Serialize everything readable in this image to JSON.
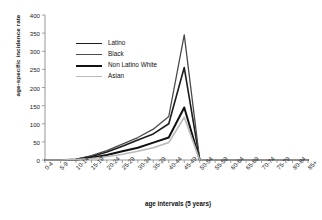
{
  "axes": {
    "ylabel": "age-specific incidence rate",
    "xlabel": "age intervals (5 years)"
  },
  "legend": {
    "position": "upper-center-left",
    "entries": [
      {
        "label": "Latino",
        "color": "#1c1c1c",
        "width": 1.6
      },
      {
        "label": "Black",
        "color": "#4a4a4a",
        "width": 1.3
      },
      {
        "label": "Non Latino White",
        "color": "#111111",
        "width": 2.0
      },
      {
        "label": "Asian",
        "color": "#b9b9b9",
        "width": 1.6
      }
    ]
  },
  "chart_data": {
    "type": "line",
    "title": "",
    "xlabel": "age intervals (5 years)",
    "ylabel": "age-specific incidence rate",
    "ylim": [
      0,
      400
    ],
    "yticks": [
      0,
      50,
      100,
      150,
      200,
      250,
      300,
      350,
      400
    ],
    "grid": false,
    "legend_position": "upper-left",
    "categories": [
      "0-4",
      "5-9",
      "10-14",
      "15-19",
      "20-24",
      "25-29",
      "30-34",
      "35-39",
      "40-44",
      "45-49",
      "50-54",
      "55-59",
      "60-64",
      "65-69",
      "70-74",
      "75-79",
      "80-84",
      "85+"
    ],
    "series": [
      {
        "name": "Latino",
        "color": "#1c1c1c",
        "width": 1.6,
        "values": [
          0,
          0,
          2,
          10,
          22,
          38,
          55,
          72,
          100,
          255,
          0,
          0,
          0,
          0,
          0,
          0,
          0,
          0
        ]
      },
      {
        "name": "Black",
        "color": "#4a4a4a",
        "width": 1.3,
        "values": [
          0,
          0,
          2,
          12,
          26,
          44,
          62,
          85,
          120,
          345,
          0,
          0,
          0,
          0,
          0,
          0,
          0,
          0
        ]
      },
      {
        "name": "Non Latino White",
        "color": "#111111",
        "width": 2.0,
        "values": [
          0,
          0,
          1,
          6,
          14,
          24,
          34,
          48,
          62,
          145,
          0,
          0,
          0,
          0,
          0,
          0,
          0,
          0
        ]
      },
      {
        "name": "Asian",
        "color": "#b9b9b9",
        "width": 1.6,
        "values": [
          0,
          0,
          1,
          4,
          9,
          16,
          24,
          34,
          48,
          118,
          0,
          0,
          0,
          0,
          0,
          0,
          0,
          0
        ]
      }
    ]
  }
}
